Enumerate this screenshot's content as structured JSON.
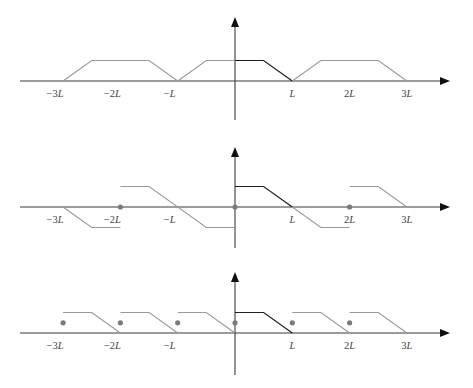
{
  "figure": {
    "colors": {
      "axis": "#3a3a3a",
      "arrow": "#111111",
      "extension_line": "#9a9a9a",
      "original_line": "#1e1e1e",
      "dot": "#7a7a7a"
    },
    "x_unit": "L",
    "plots": [
      {
        "id": "even-extension",
        "x_range": [
          -3.7,
          3.8
        ],
        "y_range": [
          -1.9,
          3.1
        ],
        "tick_labels": [
          {
            "x": -3,
            "text": "−3",
            "var": "L"
          },
          {
            "x": -2,
            "text": "−2",
            "var": "L"
          },
          {
            "x": -1,
            "text": "−",
            "var": "L"
          },
          {
            "x": 1,
            "text": "",
            "var": "L"
          },
          {
            "x": 2,
            "text": "2",
            "var": "L"
          },
          {
            "x": 3,
            "text": "3",
            "var": "L"
          }
        ],
        "segments": [
          {
            "style": "gray",
            "points": [
              [
                -3,
                0
              ],
              [
                -2.5,
                1
              ],
              [
                -1.5,
                1
              ],
              [
                -1,
                0
              ]
            ]
          },
          {
            "style": "gray",
            "points": [
              [
                -1,
                0
              ],
              [
                -0.5,
                1
              ],
              [
                0,
                1
              ]
            ]
          },
          {
            "style": "dark",
            "points": [
              [
                0,
                1
              ],
              [
                0.5,
                1
              ],
              [
                1,
                0
              ]
            ]
          },
          {
            "style": "gray",
            "points": [
              [
                1,
                0
              ],
              [
                1.5,
                1
              ],
              [
                2.5,
                1
              ],
              [
                3,
                0
              ]
            ]
          }
        ],
        "dots": []
      },
      {
        "id": "odd-extension",
        "x_range": [
          -3.7,
          3.8
        ],
        "y_range": [
          -2,
          2.9
        ],
        "tick_labels": [
          {
            "x": -3,
            "text": "−3",
            "var": "L"
          },
          {
            "x": -2,
            "text": "−2",
            "var": "L"
          },
          {
            "x": -1,
            "text": "−",
            "var": "L"
          },
          {
            "x": 1,
            "text": "",
            "var": "L"
          },
          {
            "x": 2,
            "text": "2",
            "var": "L"
          },
          {
            "x": 3,
            "text": "3",
            "var": "L"
          }
        ],
        "segments": [
          {
            "style": "gray",
            "points": [
              [
                -3,
                0
              ],
              [
                -2.5,
                -1
              ],
              [
                -2,
                -1
              ]
            ]
          },
          {
            "style": "gray",
            "points": [
              [
                -2,
                1
              ],
              [
                -1.5,
                1
              ],
              [
                -0.5,
                -1
              ],
              [
                0,
                -1
              ]
            ]
          },
          {
            "style": "dark",
            "points": [
              [
                0,
                1
              ],
              [
                0.5,
                1
              ],
              [
                1,
                0
              ]
            ]
          },
          {
            "style": "gray",
            "points": [
              [
                1,
                0
              ],
              [
                1.5,
                -1
              ],
              [
                2,
                -1
              ]
            ]
          },
          {
            "style": "gray",
            "points": [
              [
                2,
                1
              ],
              [
                2.5,
                1
              ],
              [
                3,
                0
              ]
            ]
          }
        ],
        "dots": [
          [
            -2,
            0
          ],
          [
            0,
            0
          ],
          [
            2,
            0
          ]
        ]
      },
      {
        "id": "periodic-extension-period-L",
        "x_range": [
          -3.7,
          3.8
        ],
        "y_range": [
          -2,
          2.9
        ],
        "tick_labels": [
          {
            "x": -3,
            "text": "−3",
            "var": "L"
          },
          {
            "x": -2,
            "text": "−2",
            "var": "L"
          },
          {
            "x": -1,
            "text": "−",
            "var": "L"
          },
          {
            "x": 1,
            "text": "",
            "var": "L"
          },
          {
            "x": 2,
            "text": "2",
            "var": "L"
          },
          {
            "x": 3,
            "text": "3",
            "var": "L"
          }
        ],
        "segments": [
          {
            "style": "gray",
            "points": [
              [
                -3,
                1
              ],
              [
                -2.5,
                1
              ],
              [
                -2,
                0
              ]
            ]
          },
          {
            "style": "gray",
            "points": [
              [
                -2,
                1
              ],
              [
                -1.5,
                1
              ],
              [
                -1,
                0
              ]
            ]
          },
          {
            "style": "gray",
            "points": [
              [
                -1,
                1
              ],
              [
                -0.5,
                1
              ],
              [
                0,
                0
              ]
            ]
          },
          {
            "style": "dark",
            "points": [
              [
                0,
                1
              ],
              [
                0.5,
                1
              ],
              [
                1,
                0
              ]
            ]
          },
          {
            "style": "gray",
            "points": [
              [
                1,
                1
              ],
              [
                1.5,
                1
              ],
              [
                2,
                0
              ]
            ]
          },
          {
            "style": "gray",
            "points": [
              [
                2,
                1
              ],
              [
                2.5,
                1
              ],
              [
                3,
                0
              ]
            ]
          }
        ],
        "dots": [
          [
            -3,
            0.5
          ],
          [
            -2,
            0.5
          ],
          [
            -1,
            0.5
          ],
          [
            0,
            0.5
          ],
          [
            1,
            0.5
          ],
          [
            2,
            0.5
          ]
        ]
      }
    ]
  }
}
